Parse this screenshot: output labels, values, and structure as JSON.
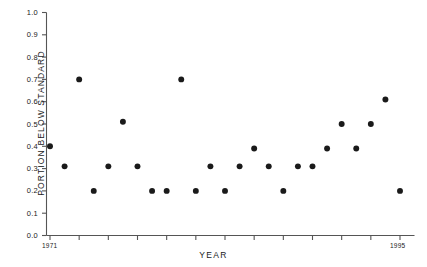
{
  "chart_data": {
    "type": "scatter",
    "title": "",
    "xlabel": "YEAR",
    "ylabel": "PORTION BELOW STANDARD",
    "xlim": [
      1971,
      1995
    ],
    "ylim": [
      0.0,
      1.0
    ],
    "grid": false,
    "legend": null,
    "y_ticks": [
      "1.0",
      "0.9",
      "0.8",
      "0.7",
      "0.6",
      "0.5",
      "0.4",
      "0.3",
      "0.2",
      "0.1",
      "0.0"
    ],
    "y_tick_values": [
      1.0,
      0.9,
      0.8,
      0.7,
      0.6,
      0.5,
      0.4,
      0.3,
      0.2,
      0.1,
      0.0
    ],
    "x_tick_labels": [
      "1971",
      "1995"
    ],
    "x_tick_count": 13,
    "marker": {
      "shape": "circle",
      "color": "#1a1a1a",
      "size": 4
    },
    "x": [
      1971,
      1972,
      1973,
      1974,
      1975,
      1976,
      1977,
      1978,
      1979,
      1980,
      1981,
      1982,
      1983,
      1984,
      1985,
      1986,
      1987,
      1988,
      1989,
      1990,
      1991,
      1992,
      1993,
      1994,
      1995
    ],
    "y": [
      0.4,
      0.31,
      0.7,
      0.2,
      0.31,
      0.51,
      0.31,
      0.2,
      0.2,
      0.7,
      0.2,
      0.31,
      0.2,
      0.31,
      0.39,
      0.31,
      0.2,
      0.31,
      0.31,
      0.39,
      0.5,
      0.39,
      0.5,
      0.61,
      0.2
    ],
    "points": [
      {
        "year": 1971,
        "value": 0.4
      },
      {
        "year": 1972,
        "value": 0.31
      },
      {
        "year": 1973,
        "value": 0.7
      },
      {
        "year": 1974,
        "value": 0.2
      },
      {
        "year": 1975,
        "value": 0.31
      },
      {
        "year": 1976,
        "value": 0.51
      },
      {
        "year": 1977,
        "value": 0.31
      },
      {
        "year": 1978,
        "value": 0.2
      },
      {
        "year": 1979,
        "value": 0.2
      },
      {
        "year": 1980,
        "value": 0.7
      },
      {
        "year": 1981,
        "value": 0.2
      },
      {
        "year": 1982,
        "value": 0.31
      },
      {
        "year": 1983,
        "value": 0.2
      },
      {
        "year": 1984,
        "value": 0.31
      },
      {
        "year": 1985,
        "value": 0.39
      },
      {
        "year": 1986,
        "value": 0.31
      },
      {
        "year": 1987,
        "value": 0.2
      },
      {
        "year": 1988,
        "value": 0.31
      },
      {
        "year": 1989,
        "value": 0.31
      },
      {
        "year": 1990,
        "value": 0.39
      },
      {
        "year": 1991,
        "value": 0.5
      },
      {
        "year": 1992,
        "value": 0.39
      },
      {
        "year": 1993,
        "value": 0.5
      },
      {
        "year": 1994,
        "value": 0.61
      },
      {
        "year": 1995,
        "value": 0.2
      }
    ]
  },
  "axes": {
    "line_color": "#555555",
    "text_color": "#1a1a1a"
  }
}
